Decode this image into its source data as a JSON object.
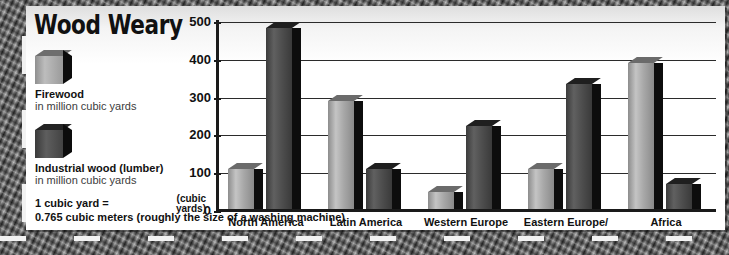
{
  "title": "Wood Weary",
  "legend": [
    {
      "key": "firewood",
      "swatch": "light-cube-icon",
      "label": "Firewood",
      "sub": "in million cubic yards"
    },
    {
      "key": "lumber",
      "swatch": "dark-cube-icon",
      "label": "Industrial wood  (lumber)",
      "sub": "in million cubic yards"
    }
  ],
  "footnote": {
    "line1": "1 cubic yard =",
    "line2": "0.765 cubic meters (roughly the size of a washing machine)"
  },
  "axis": {
    "y_caption_line1": "(cubic",
    "y_caption_line2": "yards)",
    "ticks": [
      "500",
      "400",
      "300",
      "200",
      "100",
      "0"
    ]
  },
  "colors": {
    "firewood": "#b4b4b4",
    "lumber": "#4c4c4c",
    "ink": "#111111",
    "grid": "#2b2b2b",
    "card": "#ffffff"
  },
  "chart_data": {
    "type": "bar",
    "title": "Wood Weary",
    "xlabel": "",
    "ylabel": "(cubic yards)",
    "ylim": [
      0,
      500
    ],
    "yticks": [
      0,
      100,
      200,
      300,
      400,
      500
    ],
    "grid": true,
    "legend_position": "left-panel",
    "units": "million cubic yards",
    "categories": [
      "North America",
      "Latin America",
      "Western Europe",
      "Eastern Europe/\nformer USSR",
      "Africa"
    ],
    "category_labels": [
      {
        "line1": "North America",
        "line2": ""
      },
      {
        "line1": "Latin America",
        "line2": ""
      },
      {
        "line1": "Western Europe",
        "line2": ""
      },
      {
        "line1": "Eastern Europe/",
        "line2": "former USSR"
      },
      {
        "line1": "Africa",
        "line2": ""
      }
    ],
    "series": [
      {
        "name": "Firewood",
        "values": [
          105,
          285,
          45,
          105,
          385
        ]
      },
      {
        "name": "Industrial wood (lumber)",
        "values": [
          480,
          105,
          220,
          330,
          65
        ]
      }
    ],
    "annotation": "1 cubic yard = 0.765 cubic meters (roughly the size of a washing machine)"
  }
}
